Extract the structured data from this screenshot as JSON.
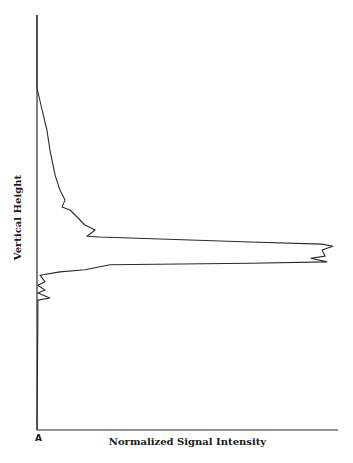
{
  "chart_data": {
    "type": "line",
    "title": "",
    "panel_label": "A",
    "xlabel": "Normalized Signal Intensity",
    "ylabel": "Vertical Height",
    "xlim": [
      0,
      1
    ],
    "ylim": [
      0,
      100
    ],
    "grid": false,
    "legend": null,
    "tick_labels": {
      "x": [],
      "y": []
    },
    "series": [
      {
        "name": "signal profile",
        "points": [
          [
            0.0,
            100.0
          ],
          [
            0.0,
            82.4
          ],
          [
            0.017,
            77.1
          ],
          [
            0.033,
            72.3
          ],
          [
            0.043,
            67.5
          ],
          [
            0.06,
            61.4
          ],
          [
            0.076,
            57.8
          ],
          [
            0.093,
            55.4
          ],
          [
            0.083,
            53.7
          ],
          [
            0.11,
            53.0
          ],
          [
            0.143,
            50.6
          ],
          [
            0.159,
            49.4
          ],
          [
            0.193,
            48.2
          ],
          [
            0.166,
            46.7
          ],
          [
            0.209,
            46.5
          ],
          [
            0.708,
            45.3
          ],
          [
            0.947,
            44.8
          ],
          [
            0.983,
            44.3
          ],
          [
            0.947,
            43.4
          ],
          [
            0.957,
            41.9
          ],
          [
            0.91,
            41.4
          ],
          [
            0.963,
            40.5
          ],
          [
            0.708,
            40.2
          ],
          [
            0.243,
            39.8
          ],
          [
            0.159,
            38.6
          ],
          [
            0.076,
            38.1
          ],
          [
            0.01,
            37.3
          ],
          [
            0.027,
            35.7
          ],
          [
            0.003,
            34.9
          ],
          [
            0.027,
            33.7
          ],
          [
            0.003,
            33.0
          ],
          [
            0.043,
            31.8
          ],
          [
            0.003,
            31.3
          ],
          [
            0.003,
            28.9
          ],
          [
            0.0,
            0.0
          ]
        ]
      }
    ],
    "annotations": [
      "Sharp peak near Vertical Height ≈ 43, intensity ≈ 0.98"
    ]
  }
}
